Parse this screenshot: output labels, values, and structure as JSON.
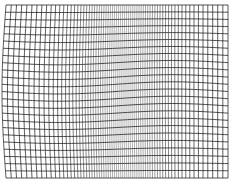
{
  "figure": {
    "background": "#ffffff",
    "line_color": "#1a1a1a",
    "bounds": {
      "left": 6,
      "right": 228,
      "top": 5,
      "bottom": 178
    },
    "vertical_lines": {
      "count": 70,
      "compression_center_x": 125,
      "compression_width": 35,
      "compression_strength": 0.55
    },
    "horizontal_lines": {
      "count": 25,
      "wave_amplitude": 2.5
    },
    "left_edge_bulge": 4
  }
}
